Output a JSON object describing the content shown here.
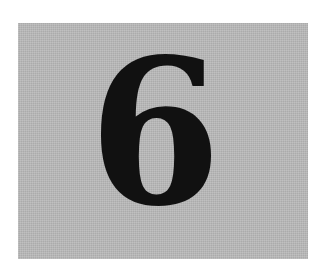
{
  "panel": {
    "numeral": "6",
    "background_color": "#b9b9b9",
    "text_color": "#111111"
  }
}
